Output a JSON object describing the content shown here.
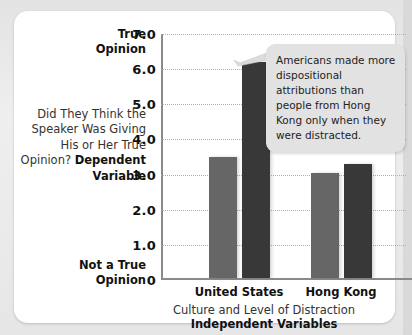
{
  "card": {
    "background_color": "#ffffff",
    "page_background_color": "#e6e6e6"
  },
  "axis_labels": {
    "y_top_label": "True\nOpinion",
    "y_top_label_line1": "True",
    "y_top_label_line2": "Opinion",
    "y_question": "Did They Think the Speaker Was Giving His or Her True Opinion?",
    "y_question_bold": "Dependent Variable",
    "y_bottom_label_line1": "Not a True",
    "y_bottom_label_line2": "Opinion",
    "x_axis_title": "Culture and Level of Distraction",
    "x_axis_title_bold": "Independent Variables"
  },
  "callout": {
    "text": "Americans made more dispositional attributions than people from Hong Kong only when they were distracted.",
    "background_color": "#e2e2e2",
    "points_to": "united-states-distracted-bar"
  },
  "chart_data": {
    "type": "bar",
    "title": "",
    "xlabel": "Culture and Level of Distraction",
    "ylabel": "Did They Think the Speaker Was Giving His or Her True Opinion?",
    "categories": [
      "United States",
      "Hong Kong"
    ],
    "ylim": [
      0,
      7.0
    ],
    "yticks": [
      7.0,
      6.0,
      5.0,
      4.0,
      3.0,
      2.0,
      1.0,
      0
    ],
    "ytick_labels": [
      "7.0",
      "6.0",
      "5.0",
      "4.0",
      "3.0",
      "2.0",
      "1.0",
      "0"
    ],
    "grid": true,
    "legend": "none",
    "series": [
      {
        "name": "Not Distracted",
        "color": "#666666",
        "values": [
          3.5,
          3.05
        ]
      },
      {
        "name": "Distracted",
        "color": "#383838",
        "values": [
          6.2,
          3.3
        ]
      }
    ],
    "bars": [
      {
        "group": "United States",
        "series": "Not Distracted",
        "value": 3.5,
        "color": "#666666"
      },
      {
        "group": "United States",
        "series": "Distracted",
        "value": 6.2,
        "color": "#383838"
      },
      {
        "group": "Hong Kong",
        "series": "Not Distracted",
        "value": 3.05,
        "color": "#666666"
      },
      {
        "group": "Hong Kong",
        "series": "Distracted",
        "value": 3.3,
        "color": "#383838"
      }
    ]
  }
}
